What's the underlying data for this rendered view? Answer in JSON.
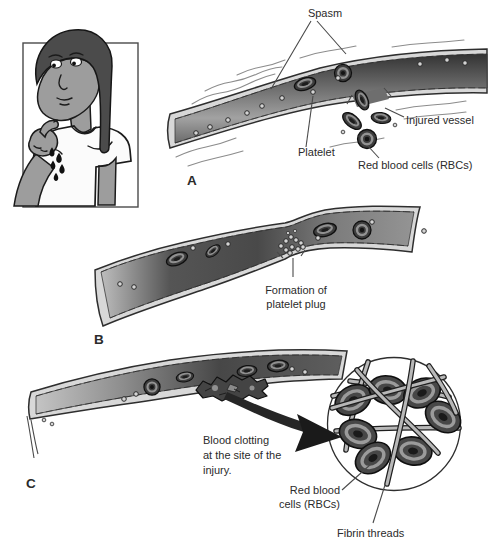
{
  "figure": {
    "panel_a": {
      "letter": "A",
      "spasm_label": "Spasm",
      "injured_vessel_label": "Injured vessel",
      "platelet_label": "Platelet",
      "rbc_label": "Red blood cells (RBCs)"
    },
    "panel_b": {
      "letter": "B",
      "plug_label_line1": "Formation of",
      "plug_label_line2": "platelet plug"
    },
    "panel_c": {
      "letter": "C",
      "clot_label_line1": "Blood clotting",
      "clot_label_line2": "at the site of the",
      "clot_label_line3": "injury.",
      "rbc_label_line1": "Red blood",
      "rbc_label_line2": "cells (RBCs)",
      "fibrin_label": "Fibrin threads"
    },
    "colors": {
      "ink": "#2b2b2b",
      "vessel_wall": "#d8d8d8",
      "vessel_interior_dark": "#3d3d3d",
      "cell_dark": "#3d3d3d",
      "fibrin_thread": "#b8b8b8",
      "blood_drop": "#111111"
    }
  }
}
